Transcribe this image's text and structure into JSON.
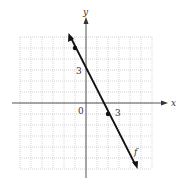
{
  "chart_data": {
    "type": "line",
    "title": "",
    "xlabel": "x",
    "ylabel": "y",
    "function_label": "f",
    "equation": "y = -2x + 3",
    "xlim": [
      -6,
      6
    ],
    "ylim": [
      -6,
      6
    ],
    "grid": true,
    "tick_labels": {
      "origin": "0",
      "x": "3",
      "y": "3"
    },
    "marked_points": [
      {
        "x": -1,
        "y": 5
      },
      {
        "x": 2,
        "y": -1
      }
    ],
    "line_endpoints": [
      {
        "x": -1.5,
        "y": 6
      },
      {
        "x": 4.5,
        "y": -6
      }
    ],
    "series": [
      {
        "name": "f",
        "x": [
          -1.5,
          4.5
        ],
        "y": [
          6,
          -6
        ]
      }
    ]
  },
  "labels": {
    "x_axis": "x",
    "y_axis": "y",
    "origin": "0",
    "x_tick": "3",
    "y_tick": "3",
    "function": "f"
  },
  "colors": {
    "axis": "#555555",
    "grid": "#bbbbbb",
    "line": "#111111"
  }
}
